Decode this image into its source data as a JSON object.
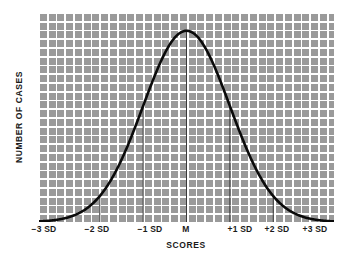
{
  "chart_data": {
    "type": "line",
    "title": "",
    "subtitle": "",
    "xlabel": "SCORES",
    "ylabel": "NUMBER OF CASES",
    "curve_name": "normal-distribution",
    "x": [
      -3,
      -2.75,
      -2.5,
      -2.25,
      -2,
      -1.75,
      -1.5,
      -1.25,
      -1,
      -0.75,
      -0.5,
      -0.25,
      0,
      0.25,
      0.5,
      0.75,
      1,
      1.25,
      1.5,
      1.75,
      2,
      2.25,
      2.5,
      2.75,
      3
    ],
    "values": [
      0.011,
      0.02,
      0.035,
      0.06,
      0.097,
      0.147,
      0.213,
      0.294,
      0.387,
      0.487,
      0.585,
      0.676,
      0.75,
      0.8,
      0.828,
      0.83,
      0.805,
      0.757,
      0.69,
      0.61,
      0.525,
      0.44,
      0.36,
      0.29,
      0.23
    ],
    "xlim": [
      -3.4,
      3.4
    ],
    "ylim": [
      0,
      1
    ],
    "xticks": [
      -3,
      -2,
      -1,
      0,
      1,
      2,
      3
    ],
    "xtick_labels": [
      "−3 SD",
      "−2 SD",
      "−1 SD",
      "M",
      "+1 SD",
      "+2 SD",
      "+3 SD"
    ],
    "yticks": [],
    "ytick_labels": [],
    "grid": true,
    "grid_color": "#ffffff",
    "plot_background": "#9a9a9a",
    "curve_color": "#000000",
    "sd_marker_color": "#3a3a3a",
    "sd_markers": [
      -2,
      -1,
      0,
      1,
      2
    ],
    "legend": "none",
    "annotations": []
  },
  "axes": {
    "x_title": "SCORES",
    "y_title": "NUMBER OF CASES",
    "x_tick_labels": [
      {
        "label": "−3 SD",
        "x_px": 44
      },
      {
        "label": "−2 SD",
        "x_px": 97
      },
      {
        "label": "−1 SD",
        "x_px": 150
      },
      {
        "label": "M",
        "x_px": 186
      },
      {
        "label": "+1 SD",
        "x_px": 240
      },
      {
        "label": "+2 SD",
        "x_px": 275
      },
      {
        "label": "+3 SD",
        "x_px": 315
      }
    ]
  }
}
